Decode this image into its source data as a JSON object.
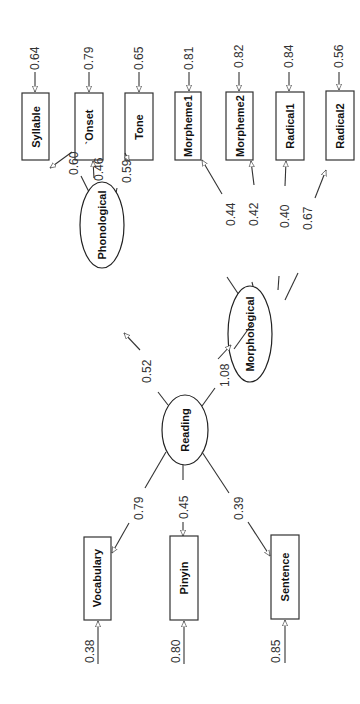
{
  "diagram": {
    "type": "structural-equation-model",
    "orientation": "rotated-90-ccw",
    "colors": {
      "stroke": "#333333",
      "text": "#111111",
      "background": "#ffffff"
    },
    "latent": {
      "reading": {
        "label": "Reading"
      },
      "phonological": {
        "label": "Phonological"
      },
      "morphological": {
        "label": "Morphological"
      }
    },
    "structural_paths": [
      {
        "from": "Reading",
        "to": "Phonological",
        "coef": "0.52"
      },
      {
        "from": "Reading",
        "to": "Morphological",
        "coef": "1.08"
      }
    ],
    "reading_indicators": [
      {
        "label": "Vocabulary",
        "loading": "0.79",
        "error": "0.38"
      },
      {
        "label": "Pinyin",
        "loading": "0.45",
        "error": "0.80"
      },
      {
        "label": "Sentence",
        "loading": "0.39",
        "error": "0.85"
      }
    ],
    "phonological_indicators": [
      {
        "label": "Syllable",
        "loading": "0.60",
        "error": "0.64"
      },
      {
        "label": "`Onset",
        "loading": "0.46",
        "error": "0.79"
      },
      {
        "label": "Tone",
        "loading": "0.59",
        "error": "0.65"
      }
    ],
    "morphological_indicators": [
      {
        "label": "Morpheme1",
        "loading": "0.44",
        "error": "0.81"
      },
      {
        "label": "Morpheme2",
        "loading": "0.42",
        "error": "0.82"
      },
      {
        "label": "Radical1",
        "loading": "0.40",
        "error": "0.84"
      },
      {
        "label": "Radical2",
        "loading": "0.67",
        "error": "0.56"
      }
    ]
  }
}
